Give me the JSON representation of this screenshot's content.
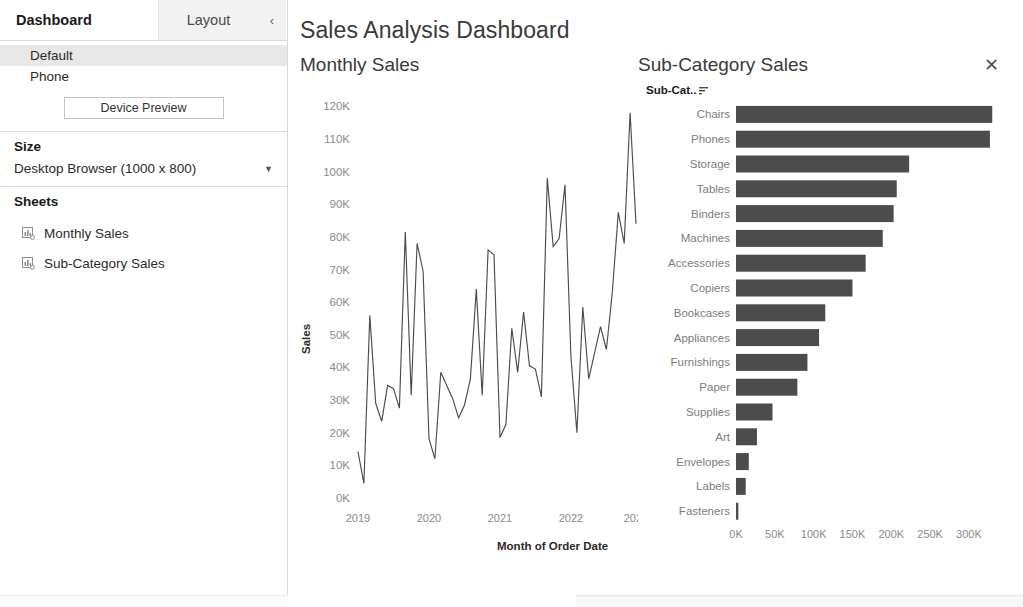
{
  "sidebar": {
    "tabs": [
      {
        "label": "Dashboard",
        "active": true
      },
      {
        "label": "Layout",
        "active": false
      }
    ],
    "collapse_icon": "chevron-left-icon",
    "device_modes": [
      {
        "label": "Default",
        "selected": true
      },
      {
        "label": "Phone",
        "selected": false
      }
    ],
    "device_preview_label": "Device Preview",
    "size": {
      "title": "Size",
      "selected": "Desktop Browser (1000 x 800)"
    },
    "sheets": {
      "title": "Sheets",
      "items": [
        {
          "label": "Monthly Sales",
          "icon": "worksheet-icon"
        },
        {
          "label": "Sub-Category Sales",
          "icon": "worksheet-icon"
        }
      ]
    }
  },
  "header": {
    "title": "Sales Analysis Dashboard"
  },
  "panes": {
    "left_title": "Monthly Sales",
    "right_title": "Sub-Category Sales",
    "close_icon": "close-icon",
    "right_field_label": "Sub-Cat..",
    "right_field_sort_icon": "sort-descending-icon"
  },
  "colors": {
    "bar": "#4c4c4c",
    "line": "#4c4c4c",
    "axis_text": "#8a8a8a",
    "title_text": "#3a3a3a",
    "selected_row": "#e8e8e8"
  },
  "chart_data": [
    {
      "id": "monthly-sales",
      "type": "line",
      "title": "Monthly Sales",
      "xlabel": "Month of Order Date",
      "ylabel": "Sales",
      "ylim": [
        0,
        125000
      ],
      "yticks": [
        0,
        10000,
        20000,
        30000,
        40000,
        50000,
        60000,
        70000,
        80000,
        90000,
        100000,
        110000,
        120000
      ],
      "ytick_labels": [
        "0K",
        "10K",
        "20K",
        "30K",
        "40K",
        "50K",
        "60K",
        "70K",
        "80K",
        "90K",
        "100K",
        "110K",
        "120K"
      ],
      "xtick_labels": [
        "2019",
        "2020",
        "2021",
        "2022",
        "2023"
      ],
      "xtick_values": [
        "2019-01",
        "2020-01",
        "2021-01",
        "2022-01",
        "2023-01"
      ],
      "grid": false,
      "x": [
        "2019-01",
        "2019-02",
        "2019-03",
        "2019-04",
        "2019-05",
        "2019-06",
        "2019-07",
        "2019-08",
        "2019-09",
        "2019-10",
        "2019-11",
        "2019-12",
        "2020-01",
        "2020-02",
        "2020-03",
        "2020-04",
        "2020-05",
        "2020-06",
        "2020-07",
        "2020-08",
        "2020-09",
        "2020-10",
        "2020-11",
        "2020-12",
        "2021-01",
        "2021-02",
        "2021-03",
        "2021-04",
        "2021-05",
        "2021-06",
        "2021-07",
        "2021-08",
        "2021-09",
        "2021-10",
        "2021-11",
        "2021-12",
        "2022-01",
        "2022-02",
        "2022-03",
        "2022-04",
        "2022-05",
        "2022-06",
        "2022-07",
        "2022-08",
        "2022-09",
        "2022-10",
        "2022-11",
        "2022-12"
      ],
      "values": [
        14200,
        4500,
        56000,
        29000,
        23500,
        34500,
        33500,
        27500,
        81500,
        31500,
        78000,
        69500,
        18200,
        12000,
        38500,
        34500,
        30500,
        24500,
        28500,
        36500,
        64000,
        31500,
        76000,
        74500,
        18500,
        22500,
        52000,
        38500,
        57000,
        40500,
        39500,
        31000,
        98000,
        77000,
        79500,
        96000,
        43500,
        20000,
        58500,
        36500,
        44500,
        52500,
        45500,
        63000,
        87500,
        78000,
        118000,
        84000
      ]
    },
    {
      "id": "sub-category-sales",
      "type": "bar",
      "orientation": "horizontal",
      "title": "Sub-Category Sales",
      "xlabel": "Sales",
      "ylabel": "Sub-Cat..",
      "xlim": [
        0,
        340000
      ],
      "xticks": [
        0,
        50000,
        100000,
        150000,
        200000,
        250000,
        300000
      ],
      "xtick_labels": [
        "0K",
        "50K",
        "100K",
        "150K",
        "200K",
        "250K",
        "300K"
      ],
      "sort": "descending",
      "categories": [
        "Chairs",
        "Phones",
        "Storage",
        "Tables",
        "Binders",
        "Machines",
        "Accessories",
        "Copiers",
        "Bookcases",
        "Appliances",
        "Furnishings",
        "Paper",
        "Supplies",
        "Art",
        "Envelopes",
        "Labels",
        "Fasteners"
      ],
      "values": [
        330000,
        327000,
        223000,
        207000,
        203000,
        189000,
        167000,
        150000,
        115000,
        107000,
        92000,
        79000,
        47000,
        27000,
        16500,
        12500,
        3000
      ]
    }
  ]
}
